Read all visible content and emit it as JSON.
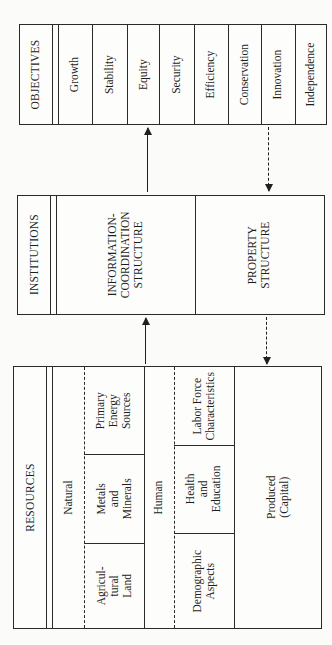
{
  "objectives": {
    "title": "OBJECTIVES",
    "items": [
      "Growth",
      "Stability",
      "Equity",
      "Security",
      "Efficiency",
      "Conservation",
      "Innovation",
      "Independence"
    ]
  },
  "institutions": {
    "title": "INSTITUTIONS",
    "info_coordination": [
      "INFORMATION-",
      "COORDINATION",
      "STRUCTURE"
    ],
    "property": [
      "PROPERTY",
      "STRUCTURE"
    ]
  },
  "resources": {
    "title": "RESOURCES",
    "natural": {
      "label": "Natural",
      "items": [
        [
          "Agricul-",
          "tural",
          "Land"
        ],
        [
          "Metals",
          "and",
          "Minerals"
        ],
        [
          "Primary",
          "Energy",
          "Sources"
        ]
      ]
    },
    "human": {
      "label": "Human",
      "items": [
        [
          "Demographic",
          "Aspects"
        ],
        [
          "Health",
          "and",
          "Education"
        ],
        [
          "Labor Force",
          "Characteristics"
        ]
      ]
    },
    "produced": [
      "Produced",
      "(Capital)"
    ]
  },
  "arrows": [
    {
      "from": "resources",
      "to": "institutions",
      "style": "solid"
    },
    {
      "from": "institutions",
      "to": "objectives",
      "style": "solid"
    },
    {
      "from": "objectives",
      "to": "institutions",
      "style": "dashed"
    },
    {
      "from": "institutions",
      "to": "resources",
      "style": "dashed"
    }
  ]
}
